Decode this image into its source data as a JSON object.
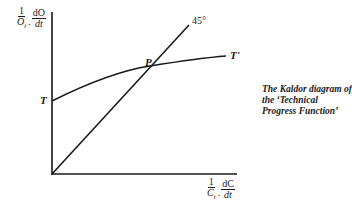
{
  "diagram": {
    "y_axis_label": {
      "num": "1",
      "den": "O",
      "den_sub": "t",
      "num2": "dO",
      "den2": "dt"
    },
    "x_axis_label": {
      "num": "1",
      "den": "C",
      "den_sub": "t",
      "num2": "dC",
      "den2": "dt"
    },
    "angle_label": "45°",
    "curve_start_label": "T",
    "curve_end_label": "T'",
    "intersection_label": "P",
    "caption": "The Kaldor diagram of the ‘Technical Progress Function’",
    "colors": {
      "line": "#1a1a1a",
      "background": "#ffffff"
    }
  }
}
